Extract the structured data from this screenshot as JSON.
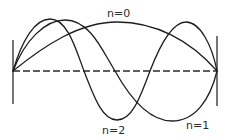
{
  "diagram": {
    "labels": {
      "n0": "n=0",
      "n1": "n=1",
      "n2": "n=2"
    },
    "colors": {
      "stroke": "#1e1e1e",
      "background": "#ffffff"
    },
    "modes": [
      {
        "name": "n=0",
        "shape": "half sine",
        "antinodes": 1
      },
      {
        "name": "n=1",
        "shape": "full sine",
        "antinodes": 2
      },
      {
        "name": "n=2",
        "shape": "one and a half sines",
        "antinodes": 3
      }
    ]
  }
}
